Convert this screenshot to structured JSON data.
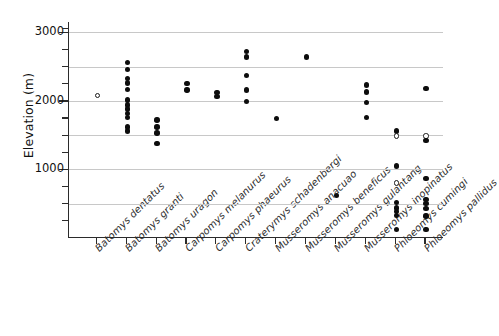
{
  "chart_data": {
    "type": "scatter",
    "title": "",
    "xlabel": "",
    "ylabel": "Elevation (m)",
    "ylim": [
      0,
      3150
    ],
    "yticks_major": [
      1000,
      2000,
      3000
    ],
    "ytick_labels": [
      "1000",
      "2000",
      "3000"
    ],
    "yticks_minor": [
      250,
      500,
      750,
      1250,
      1500,
      1750,
      2250,
      2500,
      2750,
      3050
    ],
    "gridlines": [
      500,
      1000,
      1500,
      2000,
      2500,
      3000
    ],
    "grid": true,
    "legend": "none",
    "marker_types": {
      "filled": "filled black circle",
      "open": "open white circle"
    },
    "categories": [
      "Batomys dentatus",
      "Batomys granti",
      "Batomys uragon",
      "Carpomys melanurus",
      "Carpomys phaeurus",
      "Craterymys schadenbergi",
      "Musseromys anacuao",
      "Musseromys beneficus",
      "Musseromys gulantang",
      "Musseromys inopinatus",
      "Phloeomys cumingi",
      "Phloeomys pallidus"
    ],
    "series": [
      {
        "name": "Batomys dentatus",
        "points": [
          {
            "value": 2080,
            "marker": "open"
          }
        ]
      },
      {
        "name": "Batomys granti",
        "points": [
          {
            "value": 2560,
            "marker": "filled"
          },
          {
            "value": 2460,
            "marker": "filled"
          },
          {
            "value": 2330,
            "marker": "filled"
          },
          {
            "value": 2260,
            "marker": "filled"
          },
          {
            "value": 2170,
            "marker": "filled"
          },
          {
            "value": 2010,
            "marker": "filled"
          },
          {
            "value": 1940,
            "marker": "filled"
          },
          {
            "value": 1880,
            "marker": "filled"
          },
          {
            "value": 1820,
            "marker": "filled"
          },
          {
            "value": 1760,
            "marker": "filled"
          },
          {
            "value": 1620,
            "marker": "filled"
          },
          {
            "value": 1560,
            "marker": "filled"
          }
        ]
      },
      {
        "name": "Batomys uragon",
        "points": [
          {
            "value": 1720,
            "marker": "filled"
          },
          {
            "value": 1620,
            "marker": "filled"
          },
          {
            "value": 1530,
            "marker": "filled"
          },
          {
            "value": 1380,
            "marker": "filled"
          }
        ]
      },
      {
        "name": "Carpomys melanurus",
        "points": [
          {
            "value": 2250,
            "marker": "filled"
          },
          {
            "value": 2160,
            "marker": "filled"
          }
        ]
      },
      {
        "name": "Carpomys phaeurus",
        "points": [
          {
            "value": 2120,
            "marker": "filled"
          },
          {
            "value": 2060,
            "marker": "filled"
          }
        ]
      },
      {
        "name": "Craterymys schadenbergi",
        "points": [
          {
            "value": 2720,
            "marker": "filled"
          },
          {
            "value": 2640,
            "marker": "filled"
          },
          {
            "value": 2370,
            "marker": "filled"
          },
          {
            "value": 2160,
            "marker": "filled"
          },
          {
            "value": 1990,
            "marker": "filled"
          }
        ]
      },
      {
        "name": "Musseromys anacuao",
        "points": [
          {
            "value": 1740,
            "marker": "filled"
          }
        ]
      },
      {
        "name": "Musseromys beneficus",
        "points": [
          {
            "value": 2640,
            "marker": "filled"
          }
        ]
      },
      {
        "name": "Musseromys gulantang",
        "points": [
          {
            "value": 620,
            "marker": "filled"
          }
        ]
      },
      {
        "name": "Musseromys inopinatus",
        "points": [
          {
            "value": 2230,
            "marker": "filled"
          },
          {
            "value": 2130,
            "marker": "filled"
          },
          {
            "value": 1980,
            "marker": "filled"
          },
          {
            "value": 1760,
            "marker": "filled"
          }
        ]
      },
      {
        "name": "Phloeomys cumingi",
        "points": [
          {
            "value": 1560,
            "marker": "filled"
          },
          {
            "value": 1490,
            "marker": "open"
          },
          {
            "value": 1050,
            "marker": "filled"
          },
          {
            "value": 800,
            "marker": "open"
          },
          {
            "value": 520,
            "marker": "filled"
          },
          {
            "value": 440,
            "marker": "filled"
          },
          {
            "value": 390,
            "marker": "filled"
          },
          {
            "value": 330,
            "marker": "filled"
          },
          {
            "value": 120,
            "marker": "filled"
          }
        ]
      },
      {
        "name": "Phloeomys pallidus",
        "points": [
          {
            "value": 2180,
            "marker": "filled"
          },
          {
            "value": 1490,
            "marker": "open"
          },
          {
            "value": 1420,
            "marker": "filled"
          },
          {
            "value": 870,
            "marker": "filled"
          },
          {
            "value": 560,
            "marker": "filled"
          },
          {
            "value": 500,
            "marker": "filled"
          },
          {
            "value": 430,
            "marker": "filled"
          },
          {
            "value": 320,
            "marker": "filled"
          },
          {
            "value": 120,
            "marker": "filled"
          }
        ]
      }
    ]
  }
}
